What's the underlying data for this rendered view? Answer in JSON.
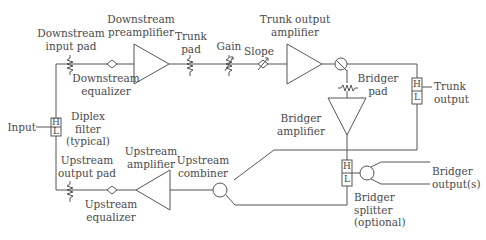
{
  "diagram": {
    "type": "block-diagram",
    "line_color": "#555555",
    "text_color": "#4a4a4a"
  },
  "labels": {
    "downstream_input_pad": [
      "Downstream",
      "input pad"
    ],
    "downstream_preamplifier": [
      "Downstream",
      "preamplifier"
    ],
    "trunk_pad": [
      "Trunk",
      "pad"
    ],
    "gain": "Gain",
    "slope": "Slope",
    "trunk_output_amplifier": [
      "Trunk output",
      "amplifier"
    ],
    "downstream_equalizer": [
      "Downstream",
      "equalizer"
    ],
    "bridger_pad": [
      "Bridger",
      "pad"
    ],
    "trunk_output": [
      "Trunk",
      "output"
    ],
    "input": "Input",
    "diplex_filter": [
      "Diplex",
      "filter",
      "(typical)"
    ],
    "bridger_amplifier": [
      "Bridger",
      "amplifier"
    ],
    "upstream_output_pad": [
      "Upstream",
      "output pad"
    ],
    "upstream_amplifier": [
      "Upstream",
      "amplifier"
    ],
    "upstream_combiner": [
      "Upstream",
      "combiner"
    ],
    "upstream_equalizer": [
      "Upstream",
      "equalizer"
    ],
    "bridger_outputs": [
      "Bridger",
      "output(s)"
    ],
    "bridger_splitter": [
      "Bridger",
      "splitter",
      "(optional)"
    ]
  },
  "filters": {
    "high": "H",
    "low": "L"
  }
}
